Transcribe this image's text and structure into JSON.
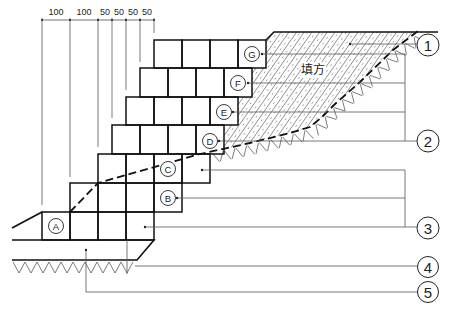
{
  "diagram": {
    "dimensions": [
      "100",
      "100",
      "50",
      "50",
      "50",
      "50"
    ],
    "block_labels": {
      "a": "A",
      "b": "B",
      "c": "C",
      "d": "D",
      "e": "E",
      "f": "F",
      "g": "G"
    },
    "callouts": {
      "c1": "1",
      "c2": "2",
      "c3": "3",
      "c4": "4",
      "c5": "5"
    },
    "fill_label": "填方"
  }
}
